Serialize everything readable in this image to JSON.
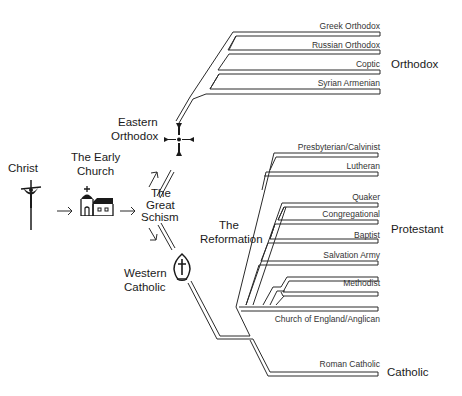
{
  "stages": {
    "christ": "Christ",
    "early_church_line1": "The Early",
    "early_church_line2": "Church",
    "schism_line1": "The",
    "schism_line2": "Great",
    "schism_line3": "Schism",
    "eastern_line1": "Eastern",
    "eastern_line2": "Orthodox",
    "western_line1": "Western",
    "western_line2": "Catholic",
    "reformation_line1": "The",
    "reformation_line2": "Reformation"
  },
  "groups": {
    "orthodox": "Orthodox",
    "protestant": "Protestant",
    "catholic": "Catholic"
  },
  "orthodox_branches": [
    "Greek Orthodox",
    "Russian Orthodox",
    "Coptic",
    "Syrian Armenian"
  ],
  "protestant_branches": [
    "Presbyterian/Calvinist",
    "Lutheran",
    "Quaker",
    "Congregational",
    "Baptist",
    "Salvation Army",
    "Methodist",
    "Church of England/Anglican"
  ],
  "catholic_branches": [
    "Roman Catholic"
  ],
  "icons": {
    "christ": "crucifix-icon",
    "early_church": "church-building-icon",
    "eastern": "maltese-cross-icon",
    "western": "mitre-icon"
  },
  "colors": {
    "line": "#2a2a2a",
    "text": "#1a1a1a",
    "background": "#ffffff"
  }
}
